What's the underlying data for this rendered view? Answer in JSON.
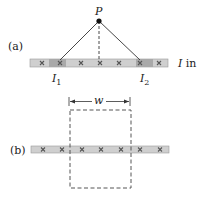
{
  "figure": {
    "panel_a": {
      "label": "(a)",
      "point_label": "P",
      "current_1_label": "I",
      "current_1_sub": "1",
      "current_2_label": "I",
      "current_2_sub": "2",
      "direction_label_var": "I",
      "direction_label_text": " in",
      "cross_count": 7
    },
    "panel_b": {
      "label": "(b)",
      "width_label": "w",
      "cross_count": 7
    },
    "colors": {
      "sheet_fill": "#cfcfcf",
      "sheet_dark": "#a9a9a9",
      "sheet_edge": "#9a9a9a",
      "cross": "#555555",
      "line": "#333333",
      "dashed": "#555555"
    }
  }
}
